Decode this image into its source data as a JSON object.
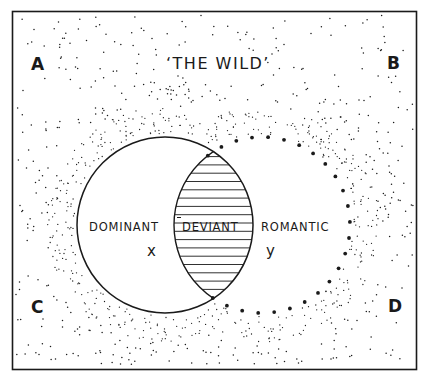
{
  "diagram": {
    "title": "‘THE WILD’",
    "corners": {
      "top_left": "A",
      "top_right": "B",
      "bottom_left": "C",
      "bottom_right": "D"
    },
    "regions": {
      "left_circle": {
        "label": "DOMINANT",
        "variable": "x",
        "style": "solid outline"
      },
      "intersection": {
        "label": "DEVIANT",
        "style": "horizontal hatching"
      },
      "right_circle": {
        "label": "ROMANTIC",
        "variable": "y",
        "style": "dotted outline"
      }
    },
    "background": "stippled dots, denser near circles",
    "colors": {
      "ink": "#1a1a1a",
      "paper": "#ffffff"
    }
  }
}
